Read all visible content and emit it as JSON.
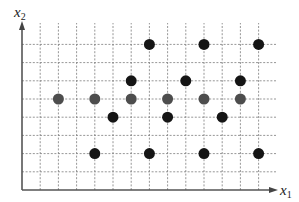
{
  "diagram": {
    "type": "scatter-lattice",
    "x_axis_label": {
      "base": "x",
      "sub": "1"
    },
    "y_axis_label": {
      "base": "x",
      "sub": "2"
    },
    "grid": {
      "origin_px": [
        22,
        190
      ],
      "spacing_px": 18.2,
      "columns": 14,
      "rows": 9,
      "x_extent_px": 276,
      "y_extent_px": 23
    },
    "colors": {
      "black_point": "#151515",
      "gray_point": "#4d4d4d"
    },
    "point_radius": 5.5,
    "points": [
      {
        "i": 7,
        "j": 8,
        "class": "black"
      },
      {
        "i": 10,
        "j": 8,
        "class": "black"
      },
      {
        "i": 13,
        "j": 8,
        "class": "black"
      },
      {
        "i": 6,
        "j": 6,
        "class": "black"
      },
      {
        "i": 9,
        "j": 6,
        "class": "black"
      },
      {
        "i": 12,
        "j": 6,
        "class": "black"
      },
      {
        "i": 2,
        "j": 5,
        "class": "gray"
      },
      {
        "i": 4,
        "j": 5,
        "class": "gray"
      },
      {
        "i": 6,
        "j": 5,
        "class": "gray"
      },
      {
        "i": 8,
        "j": 5,
        "class": "gray"
      },
      {
        "i": 10,
        "j": 5,
        "class": "gray"
      },
      {
        "i": 12,
        "j": 5,
        "class": "gray"
      },
      {
        "i": 5,
        "j": 4,
        "class": "black"
      },
      {
        "i": 8,
        "j": 4,
        "class": "black"
      },
      {
        "i": 11,
        "j": 4,
        "class": "black"
      },
      {
        "i": 4,
        "j": 2,
        "class": "black"
      },
      {
        "i": 7,
        "j": 2,
        "class": "black"
      },
      {
        "i": 10,
        "j": 2,
        "class": "black"
      },
      {
        "i": 13,
        "j": 2,
        "class": "black"
      }
    ]
  }
}
